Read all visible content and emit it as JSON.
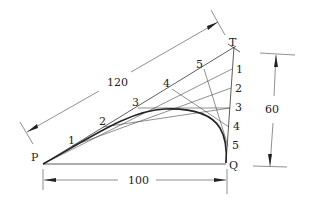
{
  "diagram": {
    "title": "",
    "points": {
      "P": {
        "label": "P",
        "x": 43,
        "y": 164
      },
      "Q": {
        "label": "Q",
        "x": 226,
        "y": 163
      },
      "T": {
        "label": "T",
        "x": 234,
        "y": 47
      }
    },
    "pt_divisions": [
      {
        "label": "1",
        "x": 72,
        "y": 146
      },
      {
        "label": "2",
        "x": 103,
        "y": 127
      },
      {
        "label": "3",
        "x": 136,
        "y": 108
      },
      {
        "label": "4",
        "x": 170,
        "y": 88
      },
      {
        "label": "5",
        "x": 202,
        "y": 67
      }
    ],
    "tq_divisions": [
      {
        "label": "1",
        "x": 232,
        "y": 69
      },
      {
        "label": "2",
        "x": 231,
        "y": 88
      },
      {
        "label": "3",
        "x": 230,
        "y": 108
      },
      {
        "label": "4",
        "x": 229,
        "y": 127
      },
      {
        "label": "5",
        "x": 228,
        "y": 146
      }
    ],
    "dimensions": {
      "pt_length": "120",
      "pq_length": "100",
      "tq_height": "60"
    }
  }
}
